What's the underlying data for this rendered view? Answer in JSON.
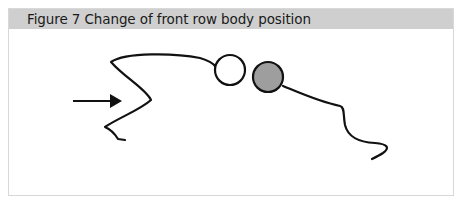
{
  "figure": {
    "title": "Figure 7  Change of front row body position",
    "header_color": "#cfcfcf",
    "elements": [
      {
        "name": "arrow",
        "direction": "right"
      },
      {
        "name": "front-row-player-body",
        "style": "curved line"
      },
      {
        "name": "player-head-white",
        "fill": "#ffffff"
      },
      {
        "name": "opponent-head-gray",
        "fill": "#9e9e9e"
      },
      {
        "name": "opponent-body",
        "style": "curved line"
      }
    ]
  }
}
